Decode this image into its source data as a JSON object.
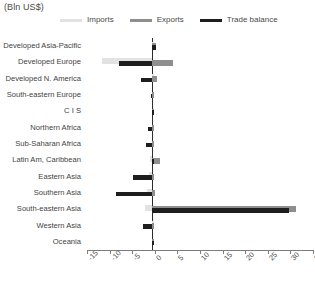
{
  "chart_data": {
    "type": "bar",
    "orientation": "horizontal",
    "title": "(Bln US$)",
    "xlabel": "",
    "ylabel": "",
    "xlim": [
      -15,
      35
    ],
    "xticks": [
      -15,
      -10,
      -5,
      0,
      5,
      10,
      15,
      20,
      25,
      30,
      35
    ],
    "grid": false,
    "legend_position": "top",
    "categories": [
      "Developed Asia-Pacific",
      "Developed Europe",
      "Developed N. America",
      "South-eastern Europe",
      "C I S",
      "Northern Africa",
      "Sub-Saharan Africa",
      "Latin Am, Caribbean",
      "Eastern Asia",
      "Southern Asia",
      "South-eastern Asia",
      "Western Asia",
      "Oceania"
    ],
    "series": [
      {
        "name": "Imports",
        "color": "#e2e2e2",
        "values": [
          0.2,
          -11.0,
          0.3,
          0.0,
          0.0,
          0.0,
          0.0,
          -0.4,
          -0.7,
          -1.2,
          -1.6,
          0.1,
          0.0
        ]
      },
      {
        "name": "Exports",
        "color": "#8e8e8e",
        "values": [
          0.9,
          4.6,
          1.1,
          0.2,
          0.1,
          0.1,
          0.3,
          1.7,
          0.5,
          0.6,
          31.8,
          0.4,
          0.2
        ]
      },
      {
        "name": "Trade balance",
        "color": "#1e1e1e",
        "values": [
          0.8,
          -7.3,
          -2.4,
          -0.3,
          0.1,
          -0.9,
          -1.3,
          0.5,
          -4.2,
          -8.0,
          30.2,
          -1.9,
          0.3
        ]
      }
    ]
  },
  "legend": {
    "items": [
      {
        "label": "Imports",
        "color": "#e2e2e2"
      },
      {
        "label": "Exports",
        "color": "#8e8e8e"
      },
      {
        "label": "Trade balance",
        "color": "#1e1e1e"
      }
    ]
  }
}
